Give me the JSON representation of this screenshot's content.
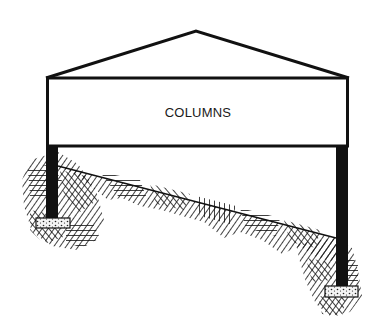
{
  "diagram": {
    "title": "COLUMNS",
    "colors": {
      "ink": "#111111",
      "background": "#ffffff",
      "footing_fill": "#f2f2f2"
    },
    "elements": {
      "roof": {
        "name": "roof-triangle",
        "peak": [
          196,
          31
        ],
        "left": [
          46,
          78
        ],
        "right": [
          349,
          78
        ]
      },
      "beam": {
        "name": "beam-box",
        "x": 46,
        "y": 78,
        "width": 303,
        "height": 68
      },
      "columns": [
        {
          "name": "left-column",
          "x": 46,
          "y": 146,
          "width": 12,
          "height": 74
        },
        {
          "name": "right-column",
          "x": 336,
          "y": 146,
          "width": 12,
          "height": 142
        }
      ],
      "footings": [
        {
          "name": "left-footing",
          "x": 36,
          "y": 218,
          "width": 34,
          "height": 10
        },
        {
          "name": "right-footing",
          "x": 325,
          "y": 286,
          "width": 33,
          "height": 11
        }
      ],
      "ground": {
        "name": "sloped-hatched-ground",
        "slope_from": [
          58,
          166
        ],
        "slope_to": [
          336,
          238
        ]
      }
    }
  }
}
